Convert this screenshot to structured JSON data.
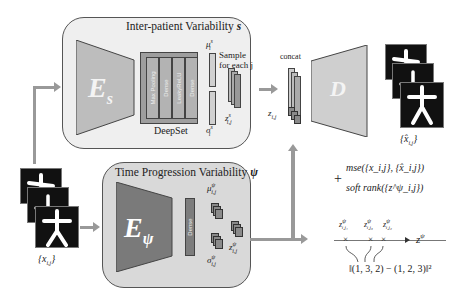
{
  "top_panel": {
    "title_text": "Inter-patient Variability ",
    "title_symbol": "s",
    "encoder_label": "E",
    "encoder_sub": "s",
    "deepset_label": "DeepSet",
    "deepset_layers": [
      "Max Pooling",
      "Dense",
      "LeakyReLU",
      "Dense"
    ],
    "mu_label": "μ",
    "mu_sup": "s",
    "mu_sub": "i",
    "sigma_label": "σ",
    "sigma_sup": "s",
    "sigma_sub": "i",
    "sample_text_1": "Sample",
    "sample_text_2": "for each j",
    "z_label": "z",
    "z_sup": "s",
    "z_sub": "i,j"
  },
  "bottom_panel": {
    "title_text": "Time Progression Variability ",
    "title_symbol": "ψ",
    "encoder_label": "E",
    "encoder_sub": "ψ",
    "dense_label": "Dense",
    "mu_label": "μ",
    "mu_sup": "ψ",
    "mu_sub": "i,j",
    "sigma_label": "σ",
    "sigma_sup": "ψ",
    "sigma_sub": "i,j",
    "z_label": "z",
    "z_sup": "ψ",
    "z_sub": "i,j"
  },
  "input": {
    "label": "{x",
    "label_sub": "i,j",
    "label_close": "}"
  },
  "concat": {
    "label": "concat",
    "z_label": "z",
    "z_sub": "i,j"
  },
  "decoder": {
    "label": "D"
  },
  "output": {
    "label": "{x̂",
    "label_sub": "i,j",
    "label_close": "}"
  },
  "loss": {
    "plus": "+",
    "mse": "mse({x_i,j}, {x̂_i,j})",
    "soft_rank": "soft rank({z^ψ_i,j})"
  },
  "axis": {
    "label": "z",
    "label_sup": "ψ",
    "points": [
      {
        "label": "z",
        "sup": "ψ",
        "sub": "i,j₁"
      },
      {
        "label": "z",
        "sup": "ψ",
        "sub": "i,j₃"
      },
      {
        "label": "z",
        "sup": "ψ",
        "sub": "i,j₂"
      }
    ],
    "rank_formula": "‖(1, 3, 2) − (1, 2, 3)‖²"
  }
}
